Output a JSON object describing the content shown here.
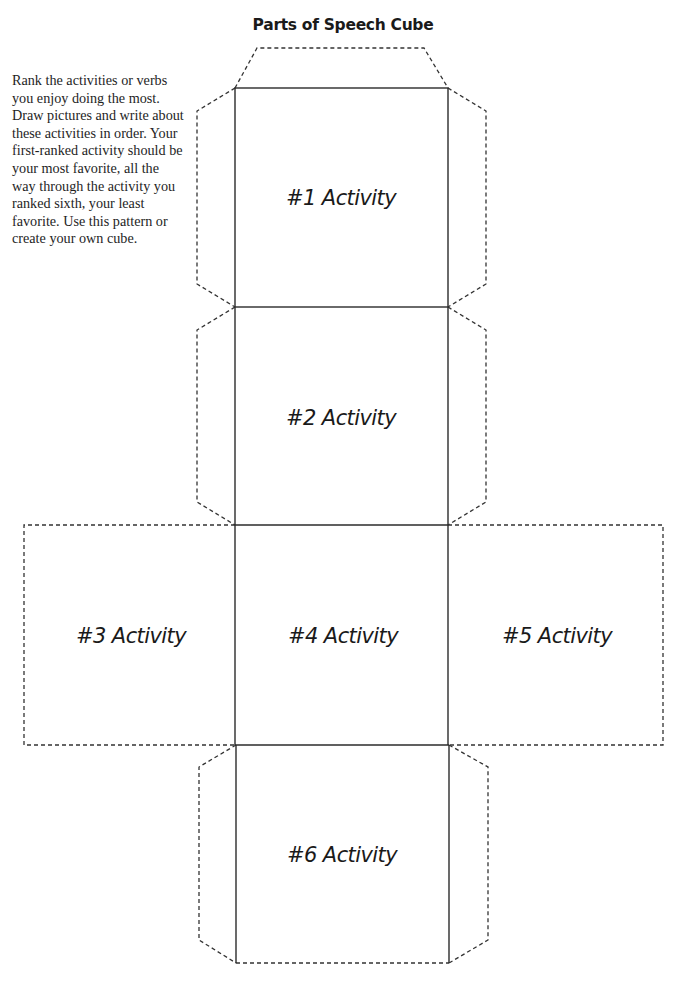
{
  "page": {
    "title": "Parts of Speech Cube",
    "instructions": "Rank the activities or verbs you enjoy doing the most. Draw pictures and write about these activities in order. Your first-ranked activity should be your most favorite, all the way through the activity you ranked sixth, your least favorite. Use this pattern or create your own cube."
  },
  "cube": {
    "faces": [
      {
        "label": "#1 Activity"
      },
      {
        "label": "#2 Activity"
      },
      {
        "label": "#3 Activity"
      },
      {
        "label": "#4 Activity"
      },
      {
        "label": "#5 Activity"
      },
      {
        "label": "#6 Activity"
      }
    ],
    "colors": {
      "solid_line": "#2b2b2b",
      "dashed_line": "#333333",
      "text": "#1a1a1a"
    }
  }
}
